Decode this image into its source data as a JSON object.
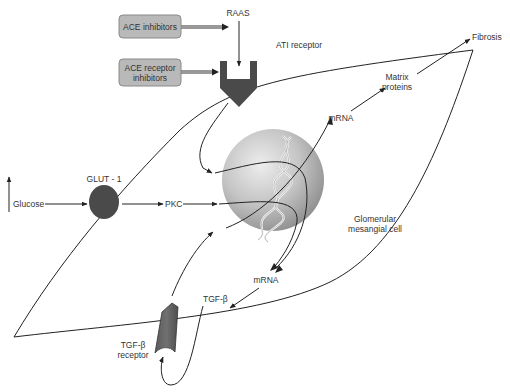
{
  "diagram": {
    "colors": {
      "drug_box_fill": "#b9b9b9",
      "drug_box_stroke": "#8a8a8a",
      "receptor_fill": "#4a4a4a",
      "glut_fill": "#4a4a4a",
      "nucleus_light": "#e6e6e6",
      "nucleus_dark": "#9a9a9a",
      "line": "#222222",
      "text": "#333333"
    },
    "drug_boxes": [
      {
        "id": "ace-inhibitors",
        "lines": [
          "ACE inhibitors"
        ]
      },
      {
        "id": "ace-receptor-inhibitors",
        "lines": [
          "ACE receptor",
          "inhibitors"
        ]
      }
    ],
    "labels": {
      "raas": "RAAS",
      "at1_receptor": "ATI receptor",
      "fibrosis": "Fibrosis",
      "matrix_proteins_1": "Matrix",
      "matrix_proteins_2": "proteins",
      "mrna_upper": "mRNA",
      "mrna_lower": "mRNA",
      "glucose": "Glucose",
      "glucose_up_arrow": "↑",
      "glut1": "GLUT - 1",
      "pkc": "PKC",
      "glomerular_1": "Glomerular",
      "glomerular_2": "mesangial cell",
      "tgf_beta": "TGF-β",
      "tgf_receptor_1": "TGF-β",
      "tgf_receptor_2": "receptor"
    },
    "nodes": [
      {
        "id": "raas",
        "label": "RAAS"
      },
      {
        "id": "at1-receptor",
        "label": "ATI receptor",
        "shape": "receptor-cup"
      },
      {
        "id": "glucose",
        "label": "Glucose",
        "modifier": "elevated"
      },
      {
        "id": "glut1",
        "label": "GLUT - 1",
        "shape": "ellipse"
      },
      {
        "id": "pkc",
        "label": "PKC"
      },
      {
        "id": "nucleus",
        "label": "",
        "shape": "sphere-with-dna"
      },
      {
        "id": "mrna-upper",
        "label": "mRNA"
      },
      {
        "id": "matrix-proteins",
        "label": "Matrix proteins"
      },
      {
        "id": "fibrosis",
        "label": "Fibrosis"
      },
      {
        "id": "mrna-lower",
        "label": "mRNA"
      },
      {
        "id": "tgf-beta",
        "label": "TGF-β"
      },
      {
        "id": "tgf-beta-receptor",
        "label": "TGF-β receptor",
        "shape": "receptor-cylinder"
      },
      {
        "id": "cell",
        "label": "Glomerular mesangial cell",
        "shape": "cell-outline"
      }
    ],
    "edges": [
      {
        "from": "ace-inhibitors",
        "to": "raas",
        "style": "double-inhibit"
      },
      {
        "from": "ace-receptor-inhibitors",
        "to": "at1-receptor",
        "style": "double-inhibit"
      },
      {
        "from": "raas",
        "to": "at1-receptor"
      },
      {
        "from": "at1-receptor",
        "to": "nucleus"
      },
      {
        "from": "glucose",
        "to": "glut1"
      },
      {
        "from": "glut1",
        "to": "pkc"
      },
      {
        "from": "pkc",
        "to": "nucleus"
      },
      {
        "from": "tgf-beta-receptor",
        "to": "nucleus"
      },
      {
        "from": "nucleus",
        "to": "mrna-upper"
      },
      {
        "from": "nucleus",
        "to": "mrna-lower"
      },
      {
        "from": "mrna-upper",
        "to": "matrix-proteins"
      },
      {
        "from": "matrix-proteins",
        "to": "fibrosis"
      },
      {
        "from": "mrna-lower",
        "to": "tgf-beta"
      },
      {
        "from": "tgf-beta",
        "to": "tgf-beta-receptor"
      }
    ]
  }
}
